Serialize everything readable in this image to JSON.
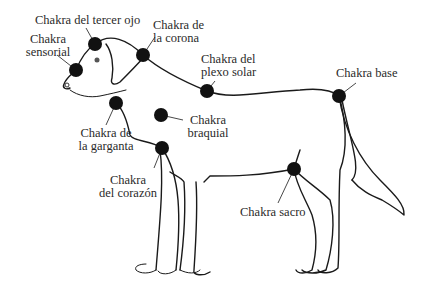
{
  "diagram": {
    "dot_color": "#111111",
    "line_color": "#1a1a1a",
    "chakras": [
      {
        "id": "tercer-ojo",
        "line1": "Chakra del tercer ojo",
        "line2": "",
        "x": 95,
        "y": 44
      },
      {
        "id": "sensorial",
        "line1": "Chakra",
        "line2": "sensorial",
        "x": 76,
        "y": 70
      },
      {
        "id": "corona",
        "line1": "Chakra de",
        "line2": "la corona",
        "x": 143,
        "y": 55
      },
      {
        "id": "plexo-solar",
        "line1": "Chakra del",
        "line2": "plexo solar",
        "x": 207,
        "y": 91
      },
      {
        "id": "base",
        "line1": "Chakra base",
        "line2": "",
        "x": 339,
        "y": 96
      },
      {
        "id": "garganta",
        "line1": "Chakra de",
        "line2": "la garganta",
        "x": 116,
        "y": 103
      },
      {
        "id": "braquial",
        "line1": "Chakra",
        "line2": "braquial",
        "x": 161,
        "y": 115
      },
      {
        "id": "corazon",
        "line1": "Chakra",
        "line2": "del corazón",
        "x": 162,
        "y": 148
      },
      {
        "id": "sacro",
        "line1": "Chakra sacro",
        "line2": "",
        "x": 294,
        "y": 169
      }
    ]
  }
}
